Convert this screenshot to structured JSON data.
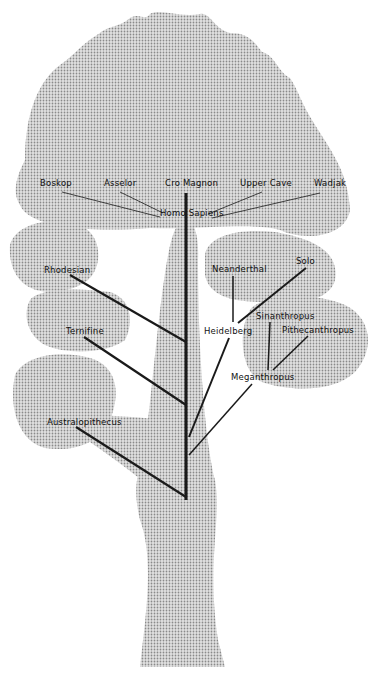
{
  "diagram": {
    "type": "phylogenetic-tree",
    "colors": {
      "foliage": "#bdbdbd",
      "dots": "#8a8a8a",
      "lines": "#1a1a1a",
      "background": "#ffffff"
    },
    "root_label": "Homo Sapiens",
    "nodes": [
      {
        "id": "boskop",
        "label": "Boskop",
        "x": 40,
        "y": 183
      },
      {
        "id": "asselor",
        "label": "Asselor",
        "x": 104,
        "y": 183
      },
      {
        "id": "cro-magnon",
        "label": "Cro Magnon",
        "x": 165,
        "y": 183
      },
      {
        "id": "upper-cave",
        "label": "Upper Cave",
        "x": 240,
        "y": 183
      },
      {
        "id": "wadjak",
        "label": "Wadjak",
        "x": 314,
        "y": 183
      },
      {
        "id": "homo-sapiens",
        "label": "Homo Sapiens",
        "x": 160,
        "y": 213
      },
      {
        "id": "rhodesian",
        "label": "Rhodesian",
        "x": 44,
        "y": 263
      },
      {
        "id": "neanderthal",
        "label": "Neanderthal",
        "x": 212,
        "y": 264
      },
      {
        "id": "solo",
        "label": "Solo",
        "x": 296,
        "y": 258
      },
      {
        "id": "ternifine",
        "label": "Ternifine",
        "x": 66,
        "y": 327
      },
      {
        "id": "heidelberg",
        "label": "Heidelberg",
        "x": 204,
        "y": 325
      },
      {
        "id": "sinanthropus",
        "label": "Sinanthropus",
        "x": 256,
        "y": 311
      },
      {
        "id": "pithecanthropus",
        "label": "Pithecanthropus",
        "x": 282,
        "y": 325
      },
      {
        "id": "meganthropus",
        "label": "Meganthropus",
        "x": 231,
        "y": 372
      },
      {
        "id": "australopithecus",
        "label": "Australopithecus",
        "x": 47,
        "y": 418
      }
    ]
  }
}
